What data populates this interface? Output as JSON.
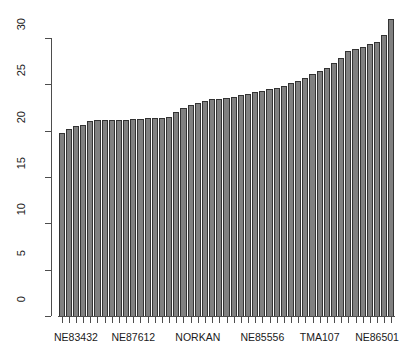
{
  "chart_data": {
    "type": "bar",
    "title": "",
    "xlabel": "",
    "ylabel": "",
    "ylim": [
      0,
      32.5
    ],
    "y_ticks": [
      0,
      5,
      10,
      15,
      20,
      25,
      30
    ],
    "grid": false,
    "legend": null,
    "bar_color": "#808080",
    "bar_border_color": "#333333",
    "axis_color": "#4d4d4d",
    "n_bars": 47,
    "x_tick_labels": [
      "NE83432",
      "NE87612",
      "NORKAN",
      "NE85556",
      "TMA107",
      "NE86501"
    ],
    "x_tick_label_indices": [
      2,
      10,
      19,
      28,
      36,
      44
    ],
    "categories": [
      "b1",
      "b2",
      "b3",
      "b4",
      "b5",
      "b6",
      "b7",
      "b8",
      "b9",
      "b10",
      "b11",
      "b12",
      "b13",
      "b14",
      "b15",
      "b16",
      "b17",
      "b18",
      "b19",
      "b20",
      "b21",
      "b22",
      "b23",
      "b24",
      "b25",
      "b26",
      "b27",
      "b28",
      "b29",
      "b30",
      "b31",
      "b32",
      "b33",
      "b34",
      "b35",
      "b36",
      "b37",
      "b38",
      "b39",
      "b40",
      "b41",
      "b42",
      "b43",
      "b44",
      "b45",
      "b46",
      "b47"
    ],
    "values": [
      19.8,
      20.2,
      20.5,
      20.6,
      21.0,
      21.1,
      21.1,
      21.2,
      21.2,
      21.2,
      21.3,
      21.3,
      21.4,
      21.4,
      21.4,
      21.5,
      22.0,
      22.4,
      22.8,
      23.0,
      23.2,
      23.4,
      23.4,
      23.5,
      23.6,
      23.8,
      24.0,
      24.2,
      24.3,
      24.5,
      24.6,
      24.8,
      25.1,
      25.4,
      25.7,
      26.1,
      26.4,
      26.8,
      27.3,
      27.8,
      28.6,
      28.8,
      29.0,
      29.3,
      29.6,
      30.3,
      32.1
    ]
  }
}
